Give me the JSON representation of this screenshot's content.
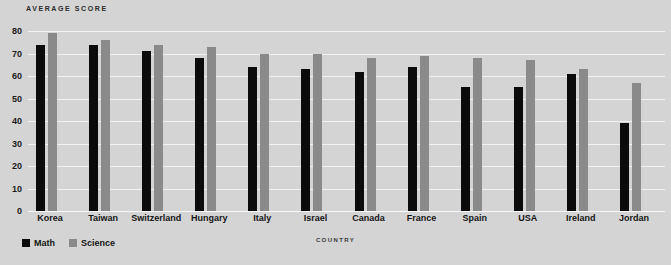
{
  "chart_data": {
    "type": "bar",
    "title": "AVERAGE SCORE",
    "xlabel": "COUNTRY",
    "ylabel": "",
    "ylim": [
      0,
      80
    ],
    "yticks": [
      0,
      10,
      20,
      30,
      40,
      50,
      60,
      70,
      80
    ],
    "grid": true,
    "legend_position": "bottom-left",
    "categories": [
      "Korea",
      "Taiwan",
      "Switzerland",
      "Hungary",
      "Italy",
      "Israel",
      "Canada",
      "France",
      "Spain",
      "USA",
      "Ireland",
      "Jordan"
    ],
    "series": [
      {
        "name": "Math",
        "color": "#0b0b0b",
        "values": [
          74,
          74,
          71,
          68,
          64,
          63,
          62,
          64,
          55,
          55,
          61,
          39
        ]
      },
      {
        "name": "Science",
        "color": "#8a8a8a",
        "values": [
          79,
          76,
          74,
          73,
          70,
          70,
          68,
          69,
          68,
          67,
          63,
          57
        ]
      }
    ]
  },
  "legend": {
    "items": [
      {
        "label": "Math",
        "color": "#0b0b0b",
        "swatch_name": "legend-swatch-math"
      },
      {
        "label": "Science",
        "color": "#8a8a8a",
        "swatch_name": "legend-swatch-science"
      }
    ]
  },
  "colors": {
    "background": "#d4d4d4",
    "gridline": "#f2f2f2",
    "text": "#141414",
    "math_bar": "#0b0b0b",
    "science_bar": "#8a8a8a"
  }
}
